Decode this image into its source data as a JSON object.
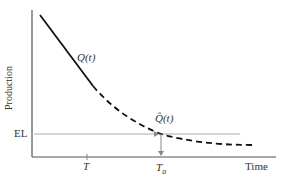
{
  "diagram": {
    "y_axis_label": "Production",
    "x_axis_label": "Time",
    "el_label": "EL",
    "curve_label_solid": "Q(t)",
    "curve_label_dashed": "Q̂(t)",
    "tick_T": "T",
    "tick_Ta": "T",
    "tick_Ta_sub": "a",
    "colors": {
      "axis": "#555555",
      "curve": "#111111",
      "el_line": "#aaaaaa",
      "arrow": "#888888"
    }
  }
}
